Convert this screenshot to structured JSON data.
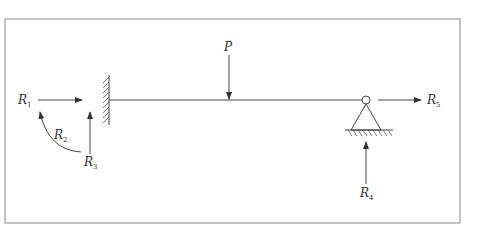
{
  "diagram": {
    "type": "structural beam free-body diagram",
    "colors": {
      "line": "#444444",
      "frame": "#888888",
      "background": "#ffffff"
    },
    "labels": {
      "load": {
        "main": "P",
        "sub": ""
      },
      "r1": {
        "main": "R",
        "sub": "1"
      },
      "r2": {
        "main": "R",
        "sub": "2"
      },
      "r3": {
        "main": "R",
        "sub": "3"
      },
      "r4": {
        "main": "R",
        "sub": "4"
      },
      "r5": {
        "main": "R",
        "sub": "5"
      }
    },
    "elements": [
      {
        "id": "fixed-support",
        "kind": "wall with hatching",
        "side": "left"
      },
      {
        "id": "beam",
        "kind": "horizontal line"
      },
      {
        "id": "pin-support",
        "kind": "pin with triangle and hatched ground",
        "side": "right"
      },
      {
        "id": "load-P",
        "kind": "downward arrow"
      },
      {
        "id": "R1",
        "kind": "horizontal arrow right",
        "at": "left support"
      },
      {
        "id": "R2",
        "kind": "curved moment arrow",
        "at": "left support"
      },
      {
        "id": "R3",
        "kind": "vertical arrow up",
        "at": "left support"
      },
      {
        "id": "R4",
        "kind": "vertical arrow up",
        "at": "right support"
      },
      {
        "id": "R5",
        "kind": "horizontal arrow right",
        "at": "right support"
      }
    ]
  }
}
